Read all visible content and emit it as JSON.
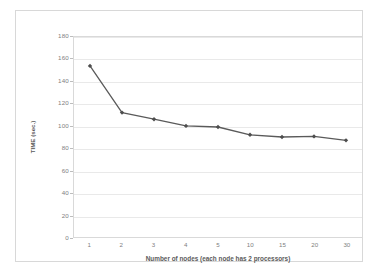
{
  "chart_data": {
    "type": "line",
    "title": "",
    "xlabel": "Number of nodes (each node has 2 processors)",
    "ylabel": "TIME (sec.)",
    "categories": [
      "1",
      "2",
      "3",
      "4",
      "5",
      "10",
      "15",
      "20",
      "30"
    ],
    "values": [
      154,
      112,
      106,
      100,
      99,
      92,
      90,
      90.5,
      87
    ],
    "series": [
      {
        "name": "TIME (sec.)",
        "values": [
          154,
          112,
          106,
          100,
          99,
          92,
          90,
          90.5,
          87
        ]
      }
    ],
    "ylim": [
      0,
      180
    ],
    "ytick_labels": [
      "0",
      "20",
      "40",
      "60",
      "80",
      "100",
      "120",
      "140",
      "160",
      "180"
    ],
    "ytick_values": [
      0,
      20,
      40,
      60,
      80,
      100,
      120,
      140,
      160,
      180
    ],
    "grid": true,
    "legend": false,
    "legend_position": "none",
    "marker": "diamond",
    "line_color": "#5a5a5a",
    "marker_color": "#4d4d4d",
    "grid_color": "#e9e9e9",
    "axis_color": "#d9d9d9",
    "text_color": "#808080",
    "title_color": "#5a5a5a",
    "background": "#ffffff"
  }
}
